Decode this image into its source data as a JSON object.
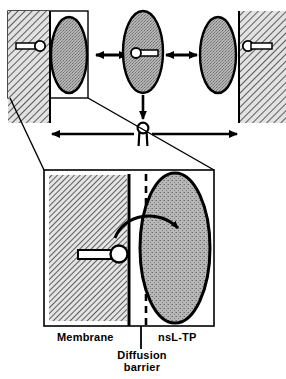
{
  "figure": {
    "type": "schematic-diagram",
    "background_color": "#ffffff",
    "ink_color": "#000000",
    "membrane_fill": "#d8d8d8",
    "protein_fill": "#a8a8a8"
  },
  "labels": {
    "membrane": "Membrane",
    "nsl_tp": "nsL-TP",
    "diffusion_barrier_line1": "Diffusion",
    "diffusion_barrier_line2": "barrier"
  },
  "top_panel": {
    "description": "Three states of nsL-TP shuttling a lipid between two membranes",
    "states": [
      {
        "name": "donor-membrane-docked",
        "position": "left",
        "membrane_side": "left",
        "protein_shape": "ellipse",
        "lipid_location": "membrane",
        "boxed": true
      },
      {
        "name": "protein-carrying-lipid",
        "position": "center",
        "membrane_side": "none",
        "protein_shape": "ellipse",
        "lipid_location": "protein-cavity",
        "boxed": false
      },
      {
        "name": "acceptor-membrane-docked",
        "position": "right",
        "membrane_side": "right",
        "protein_shape": "ellipse",
        "lipid_location": "membrane",
        "boxed": false
      }
    ],
    "arrows": [
      {
        "name": "exchange-arrow-left",
        "type": "double-headed",
        "orientation": "horizontal"
      },
      {
        "name": "exchange-arrow-right",
        "type": "double-headed",
        "orientation": "horizontal"
      },
      {
        "name": "release-arrow",
        "type": "single-headed",
        "orientation": "vertical-down"
      },
      {
        "name": "transfer-span-arrow",
        "type": "double-headed",
        "orientation": "horizontal"
      }
    ],
    "free_lipid": {
      "name": "free-lipid-molecule",
      "glyph": "head-and-two-tails"
    }
  },
  "detail_panel": {
    "description": "Magnified view of membrane surface, diffusion barrier and nsL-TP",
    "elements": [
      {
        "name": "membrane-region",
        "fill": "hatched"
      },
      {
        "name": "membrane-boundary-line",
        "style": "solid"
      },
      {
        "name": "diffusion-barrier-line",
        "style": "dashed"
      },
      {
        "name": "nsl-tp-protein",
        "shape": "ellipse",
        "fill": "stippled"
      },
      {
        "name": "lipid-molecule",
        "glyph": "circle-head-with-tail"
      },
      {
        "name": "transfer-arrow",
        "type": "curved",
        "direction": "membrane-to-protein"
      }
    ]
  }
}
